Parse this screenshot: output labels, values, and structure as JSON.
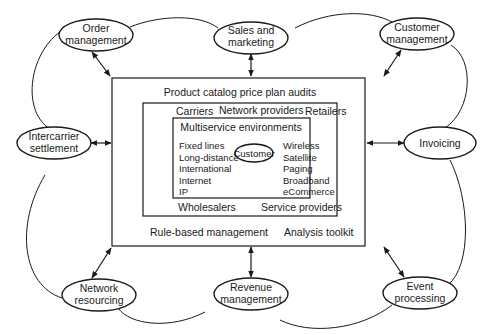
{
  "diagram": {
    "outer_box": {
      "title": "Product catalog price plan audits",
      "bottom_left": "Rule-based management",
      "bottom_right": "Analysis toolkit"
    },
    "middle_box": {
      "top": [
        "Carriers",
        "Network providers",
        "Retailers"
      ],
      "bottom": [
        "Wholesalers",
        "Service providers"
      ]
    },
    "inner_box": {
      "title": "Multiservice environments",
      "left_items": [
        "Fixed lines",
        "Long-distance",
        "International",
        "Internet",
        "IP"
      ],
      "center": "Customer",
      "right_items": [
        "Wireless",
        "Satellite",
        "Paging",
        "Broadband",
        "eCommerce"
      ]
    },
    "nodes": {
      "order": [
        "Order",
        "management"
      ],
      "sales": [
        "Sales and",
        "marketing"
      ],
      "customer_mgmt": [
        "Customer",
        "management"
      ],
      "intercarrier": [
        "Intercarrier",
        "settlement"
      ],
      "invoicing": [
        "Invoicing"
      ],
      "network": [
        "Network",
        "resourcing"
      ],
      "revenue": [
        "Revenue",
        "management"
      ],
      "event": [
        "Event",
        "processing"
      ]
    }
  }
}
